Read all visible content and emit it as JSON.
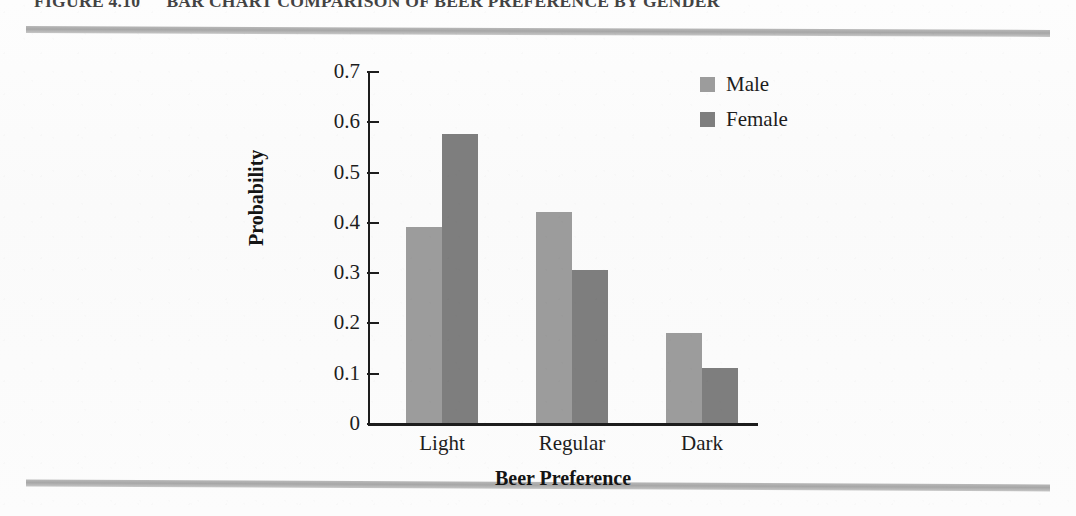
{
  "caption": {
    "figure_number": "FIGURE 4.10",
    "title": "BAR CHART COMPARISON OF BEER PREFERENCE BY GENDER"
  },
  "legend": {
    "position": "top-right",
    "entries": [
      {
        "label": "Male",
        "color": "#9c9c9c"
      },
      {
        "label": "Female",
        "color": "#7e7e7e"
      }
    ]
  },
  "axes": {
    "y_title": "Probability",
    "x_title": "Beer Preference",
    "y_ticks": [
      "0.7",
      "0.6",
      "0.5",
      "0.4",
      "0.3",
      "0.2",
      "0.1",
      "0"
    ]
  },
  "chart_data": {
    "type": "bar",
    "title": "BAR CHART COMPARISON OF BEER PREFERENCE BY GENDER",
    "xlabel": "Beer Preference",
    "ylabel": "Probability",
    "categories": [
      "Light",
      "Regular",
      "Dark"
    ],
    "series": [
      {
        "name": "Male",
        "color": "#9c9c9c",
        "values": [
          0.39,
          0.42,
          0.18
        ]
      },
      {
        "name": "Female",
        "color": "#7e7e7e",
        "values": [
          0.575,
          0.305,
          0.11
        ]
      }
    ],
    "ylim": [
      0,
      0.7
    ],
    "ytick_values": [
      0,
      0.1,
      0.2,
      0.3,
      0.4,
      0.5,
      0.6,
      0.7
    ],
    "grid": false,
    "legend_position": "top-right"
  },
  "decor": {
    "rule_color": "#a2a2a2"
  }
}
